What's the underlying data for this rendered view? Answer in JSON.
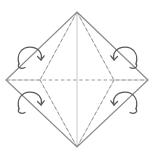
{
  "figure": {
    "type": "origami-crease-pattern",
    "canvas": {
      "width": 155,
      "height": 158,
      "background": "#ffffff"
    },
    "colors": {
      "outline": "#8a8a8a",
      "crease_dashed": "#9a9a9a",
      "fold_line_light": "#cfcfcf",
      "arrow": "#5a5a5a",
      "background": "#ffffff"
    },
    "vertices": {
      "top": {
        "label": "top-vertex",
        "x": 77,
        "y": 12
      },
      "right": {
        "label": "right-vertex",
        "x": 148,
        "y": 80
      },
      "bottom": {
        "label": "bottom-vertex",
        "x": 77,
        "y": 147
      },
      "left": {
        "label": "left-vertex",
        "x": 6,
        "y": 80
      },
      "inner_left": {
        "label": "inner-left-node",
        "x": 40,
        "y": 80
      },
      "inner_right": {
        "label": "inner-right-node",
        "x": 114,
        "y": 80
      }
    },
    "outline_path": "M 77 12 L 148 80 L 77 147 L 6 80 Z",
    "creases": [
      {
        "name": "horizontal-crease",
        "style": "dashed",
        "path": "M 6 80 L 148 80"
      },
      {
        "name": "vertical-crease",
        "style": "light",
        "path": "M 77 12 L 77 147"
      },
      {
        "name": "crease-top-to-inner-left",
        "style": "dashed",
        "path": "M 77 12 L 40 80"
      },
      {
        "name": "crease-top-to-inner-right",
        "style": "dashed",
        "path": "M 77 12 L 114 80"
      },
      {
        "name": "crease-bottom-to-inner-left",
        "style": "dashed",
        "path": "M 77 147 L 40 80"
      },
      {
        "name": "crease-bottom-to-inner-right",
        "style": "dashed",
        "path": "M 77 147 L 114 80"
      },
      {
        "name": "fold-line-upper-left",
        "style": "light",
        "path": "M 6 80 L 40 80"
      },
      {
        "name": "fold-line-upper-right",
        "style": "light",
        "path": "M 114 80 L 148 80"
      },
      {
        "name": "petal-left-upper",
        "style": "light",
        "path": "M 40 80 L 77 12"
      },
      {
        "name": "petal-right-upper",
        "style": "light",
        "path": "M 114 80 L 77 12"
      },
      {
        "name": "petal-left-lower",
        "style": "light",
        "path": "M 40 80 L 77 147"
      },
      {
        "name": "petal-right-lower",
        "style": "light",
        "path": "M 114 80 L 77 147"
      }
    ],
    "arrows": [
      {
        "name": "fold-arrow-top-left",
        "cx": 31,
        "cy": 58,
        "direction": "clockwise",
        "mirrored": false
      },
      {
        "name": "fold-arrow-top-right",
        "cx": 124,
        "cy": 58,
        "direction": "counter-clockwise",
        "mirrored": true
      },
      {
        "name": "fold-arrow-bottom-left",
        "cx": 31,
        "cy": 103,
        "direction": "clockwise",
        "mirrored": false
      },
      {
        "name": "fold-arrow-bottom-right",
        "cx": 124,
        "cy": 103,
        "direction": "counter-clockwise",
        "mirrored": true
      }
    ]
  }
}
